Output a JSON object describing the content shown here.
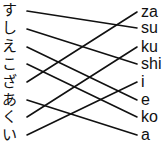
{
  "diagram": {
    "type": "matching-lines",
    "left_items": [
      {
        "label": "す",
        "y": 11
      },
      {
        "label": "し",
        "y": 29
      },
      {
        "label": "え",
        "y": 47
      },
      {
        "label": "こ",
        "y": 64
      },
      {
        "label": "ざ",
        "y": 82
      },
      {
        "label": "あ",
        "y": 100
      },
      {
        "label": "く",
        "y": 117
      },
      {
        "label": "い",
        "y": 135
      }
    ],
    "right_items": [
      {
        "label": "za",
        "y": 12
      },
      {
        "label": "su",
        "y": 28
      },
      {
        "label": "ku",
        "y": 47
      },
      {
        "label": "shi",
        "y": 64
      },
      {
        "label": "i",
        "y": 82
      },
      {
        "label": "e",
        "y": 100
      },
      {
        "label": "ko",
        "y": 117
      },
      {
        "label": "a",
        "y": 135
      }
    ],
    "connections": [
      {
        "from": "す",
        "to": "su"
      },
      {
        "from": "し",
        "to": "shi"
      },
      {
        "from": "え",
        "to": "e"
      },
      {
        "from": "こ",
        "to": "ko"
      },
      {
        "from": "ざ",
        "to": "za"
      },
      {
        "from": "あ",
        "to": "a"
      },
      {
        "from": "く",
        "to": "ku"
      },
      {
        "from": "い",
        "to": "i"
      }
    ],
    "line_color": "#111111",
    "background": "#ffffff"
  }
}
